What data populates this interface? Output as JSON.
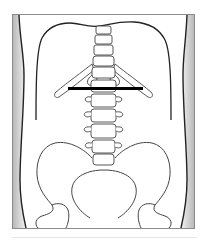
{
  "figure": {
    "type": "anatomical-illustration",
    "marker": "horizontal-line-at-L1-level"
  },
  "colors": {
    "background": "#ffffff",
    "frame_stroke": "#8a8a8a",
    "side_shading": "#c8c8c8",
    "outline": "#222222",
    "bone_stroke": "#444444",
    "marker": "#000000"
  }
}
